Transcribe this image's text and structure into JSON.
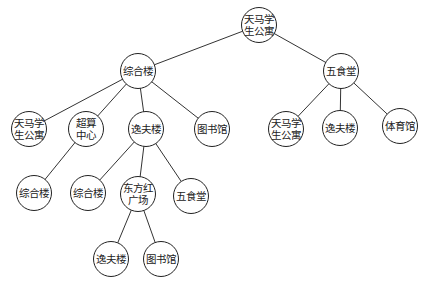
{
  "diagram": {
    "type": "tree",
    "nodes": [
      {
        "id": "n0",
        "label": "天马学生公寓",
        "x": 259,
        "y": 25,
        "parent": null
      },
      {
        "id": "n1",
        "label": "综合楼",
        "x": 138,
        "y": 71,
        "parent": "n0"
      },
      {
        "id": "n2",
        "label": "五食堂",
        "x": 341,
        "y": 71,
        "parent": "n0"
      },
      {
        "id": "n3",
        "label": "天马学生公寓",
        "x": 29,
        "y": 129,
        "parent": "n1"
      },
      {
        "id": "n4",
        "label": "超算中心",
        "x": 86,
        "y": 129,
        "parent": "n1"
      },
      {
        "id": "n5",
        "label": "逸夫楼",
        "x": 146,
        "y": 129,
        "parent": "n1"
      },
      {
        "id": "n6",
        "label": "图书馆",
        "x": 212,
        "y": 129,
        "parent": "n1"
      },
      {
        "id": "n7",
        "label": "天马学生公寓",
        "x": 286,
        "y": 129,
        "parent": "n2"
      },
      {
        "id": "n8",
        "label": "逸夫楼",
        "x": 340,
        "y": 128,
        "parent": "n2"
      },
      {
        "id": "n9",
        "label": "体育馆",
        "x": 400,
        "y": 126,
        "parent": "n2"
      },
      {
        "id": "n10",
        "label": "综合楼",
        "x": 34,
        "y": 193,
        "parent": "n4"
      },
      {
        "id": "n11",
        "label": "综合楼",
        "x": 88,
        "y": 193,
        "parent": "n5"
      },
      {
        "id": "n12",
        "label": "东方红广场",
        "x": 138,
        "y": 194,
        "parent": "n5"
      },
      {
        "id": "n13",
        "label": "五食堂",
        "x": 191,
        "y": 196,
        "parent": "n5"
      },
      {
        "id": "n14",
        "label": "逸夫楼",
        "x": 111,
        "y": 259,
        "parent": "n12"
      },
      {
        "id": "n15",
        "label": "图书馆",
        "x": 161,
        "y": 259,
        "parent": "n12"
      }
    ]
  },
  "labels": {
    "n0": "天马学生公寓",
    "n1": "综合楼",
    "n2": "五食堂",
    "n3": "天马学生公寓",
    "n4": "超算中心",
    "n5": "逸夫楼",
    "n6": "图书馆",
    "n7": "天马学生公寓",
    "n8": "逸夫楼",
    "n9": "体育馆",
    "n10": "综合楼",
    "n11": "综合楼",
    "n12": "东方红广场",
    "n13": "五食堂",
    "n14": "逸夫楼",
    "n15": "图书馆"
  }
}
